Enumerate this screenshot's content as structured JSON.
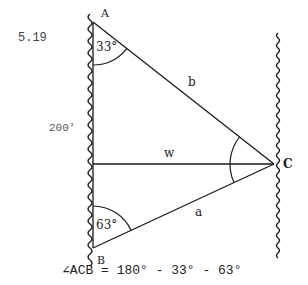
{
  "problem_number": "5.19",
  "distance_label": "200'",
  "vertices": {
    "A": "A",
    "B": "B",
    "C": "C"
  },
  "sides": {
    "a": "a",
    "b": "b",
    "w": "w"
  },
  "angles": {
    "A": "33°",
    "B": "63°"
  },
  "formula": "∠ACB = 180° - 33° - 63°",
  "colors": {
    "ink": "#1a1a1a",
    "background": "#ffffff"
  }
}
